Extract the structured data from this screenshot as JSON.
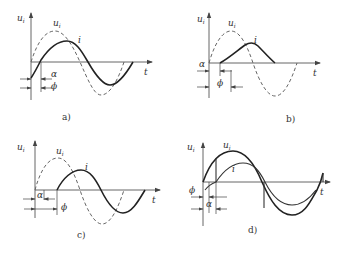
{
  "figure": {
    "panels": [
      {
        "id": "a",
        "caption": "a)",
        "y_label": "u_i",
        "y_label_main": "u",
        "y_label_sub": "i",
        "curve_voltage": "u_i",
        "curve_current": "i",
        "x_label": "t",
        "angle1": "α",
        "angle2": "ϕ"
      },
      {
        "id": "b",
        "caption": "b)",
        "y_label": "u_i",
        "y_label_main": "u",
        "y_label_sub": "i",
        "curve_voltage": "u_i",
        "curve_current": "i",
        "x_label": "t",
        "angle1": "α",
        "angle2": "ϕ"
      },
      {
        "id": "c",
        "caption": "c)",
        "y_label": "u_i",
        "y_label_main": "u",
        "y_label_sub": "i",
        "curve_voltage": "u_i",
        "curve_current": "i",
        "x_label": "t",
        "angle1": "α",
        "angle2": "ϕ"
      },
      {
        "id": "d",
        "caption": "d)",
        "y_label": "u_i",
        "y_label_main": "u",
        "y_label_sub": "i",
        "curve_voltage": "u_i",
        "curve_current": "i",
        "x_label": "t",
        "angle1": "α",
        "angle2": "ϕ"
      }
    ]
  }
}
